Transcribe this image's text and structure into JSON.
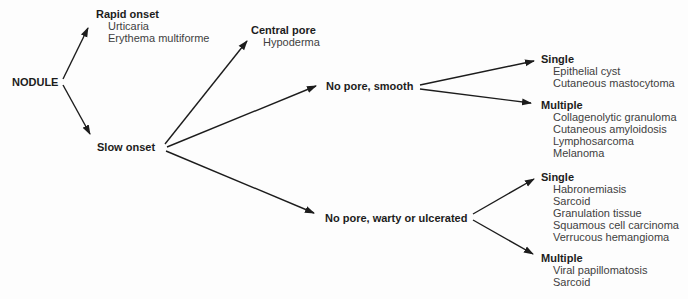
{
  "diagram": {
    "title_hint": "Diagnostic decision tree",
    "root": "NODULE",
    "rapid_onset": {
      "label": "Rapid onset",
      "items": [
        "Urticaria",
        "Erythema multiforme"
      ]
    },
    "slow_onset": {
      "label": "Slow onset"
    },
    "central_pore": {
      "label": "Central pore",
      "items": [
        "Hypoderma"
      ]
    },
    "no_pore_smooth": {
      "label": "No pore, smooth"
    },
    "smooth_single": {
      "label": "Single",
      "items": [
        "Epithelial cyst",
        "Cutaneous mastocytoma"
      ]
    },
    "smooth_multiple": {
      "label": "Multiple",
      "items": [
        "Collagenolytic granuloma",
        "Cutaneous amyloidosis",
        "Lymphosarcoma",
        "Melanoma"
      ]
    },
    "no_pore_warty": {
      "label": "No pore, warty or ulcerated"
    },
    "warty_single": {
      "label": "Single",
      "items": [
        "Habronemiasis",
        "Sarcoid",
        "Granulation tissue",
        "Squamous cell carcinoma",
        "Verrucous hemangioma"
      ]
    },
    "warty_multiple": {
      "label": "Multiple",
      "items": [
        "Viral papillomatosis",
        "Sarcoid"
      ]
    }
  },
  "colors": {
    "background": "#fdfdfd",
    "heading_text": "#1c1c1c",
    "item_text": "#3f3f3f",
    "line": "#1c1c1c"
  }
}
